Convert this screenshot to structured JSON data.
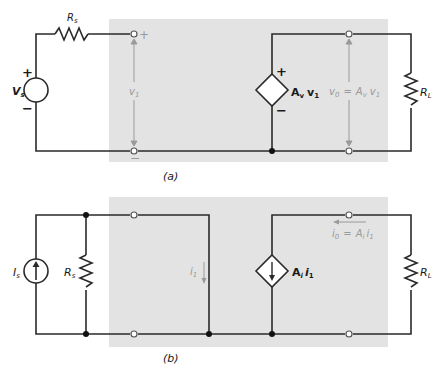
{
  "colors": {
    "background": "#ffffff",
    "shade": "#e3e3e3",
    "wire": "#2a2a2a",
    "gray_annotation": "#9a9a9a"
  },
  "circuit_a": {
    "caption": "(a)",
    "source_label": "V",
    "source_sub": "s",
    "source_plus": "+",
    "source_minus": "−",
    "rs_label": "R",
    "rs_sub": "s",
    "input_plus": "+",
    "input_minus": "−",
    "v1_label": "v",
    "v1_sub": "1",
    "dep_source_label": "A",
    "dep_source_sub": "v",
    "dep_source_var": "v",
    "dep_source_var_sub": "1",
    "dep_plus": "+",
    "dep_minus": "−",
    "vo_label": "v",
    "vo_sub": "0",
    "vo_eq": "=",
    "vo_rhs": "A",
    "vo_rhs_sub": "v",
    "vo_rhs_var": "v",
    "vo_rhs_var_sub": "1",
    "rl_label": "R",
    "rl_sub": "L"
  },
  "circuit_b": {
    "caption": "(b)",
    "source_label": "I",
    "source_sub": "s",
    "rs_label": "R",
    "rs_sub": "s",
    "i1_label": "i",
    "i1_sub": "1",
    "dep_source_label": "A",
    "dep_source_sub": "i",
    "dep_source_var": "i",
    "dep_source_var_sub": "1",
    "io_label": "i",
    "io_sub": "0",
    "io_eq": "=",
    "io_rhs": "A",
    "io_rhs_sub": "i",
    "io_rhs_var": "i",
    "io_rhs_var_sub": "1",
    "rl_label": "R",
    "rl_sub": "L"
  }
}
